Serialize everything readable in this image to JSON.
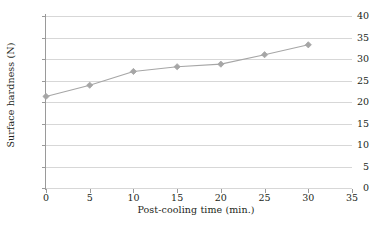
{
  "chart_data": {
    "type": "line",
    "title": "",
    "xlabel": "Post-cooling time (min.)",
    "ylabel": "Surface hardness (N)",
    "x": [
      0,
      5,
      10,
      15,
      20,
      25,
      30
    ],
    "values": [
      21.3,
      23.9,
      27.1,
      28.2,
      28.8,
      31.0,
      33.3
    ],
    "series": [
      {
        "name": "Surface hardness",
        "values": [
          21.3,
          23.9,
          27.1,
          28.2,
          28.8,
          31.0,
          33.3
        ]
      }
    ],
    "xlim": [
      0,
      35
    ],
    "ylim": [
      0,
      40
    ],
    "xticks": [
      "0",
      "5",
      "10",
      "15",
      "20",
      "25",
      "30",
      "35"
    ],
    "yticks": [
      "0",
      "5",
      "10",
      "15",
      "20",
      "25",
      "30",
      "35",
      "40"
    ],
    "xtick_values": [
      0,
      5,
      10,
      15,
      20,
      25,
      30,
      35
    ],
    "ytick_values": [
      0,
      5,
      10,
      15,
      20,
      25,
      30,
      35,
      40
    ],
    "grid": "horizontal",
    "legend": "none",
    "marker": "diamond",
    "colors": {
      "line": "#a6a6a6",
      "marker": "#a6a6a6",
      "gridline": "#d7d7d7",
      "axis": "#9a9a9a",
      "text": "#231f20",
      "background": "#ffffff"
    }
  }
}
